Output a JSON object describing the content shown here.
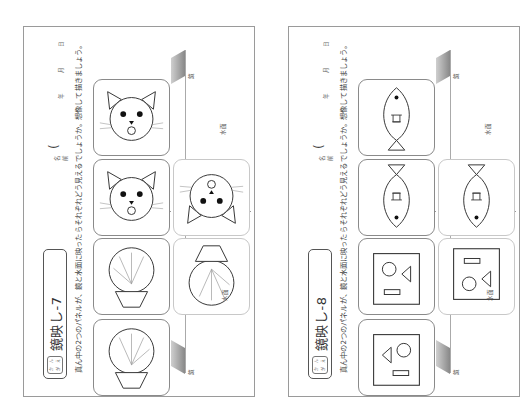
{
  "layout": {
    "orientation": "rotated-90-ccw",
    "pages_visible": 2
  },
  "pages": [
    {
      "title": "鏡映し-7",
      "grade_badge": [
        "か",
        "ん",
        "が",
        "え"
      ],
      "instructions": "真ん中の2つのパネルが、鏡と水面に映ったらそれぞれどう見えるでしょうか。想像して描きましょう。",
      "name_label": "名前",
      "date": {
        "year": "年",
        "month": "月",
        "day": "日"
      },
      "labels": {
        "mirror": "鏡",
        "water": "水面"
      },
      "panels": [
        {
          "position": "mirror-top",
          "figure": "cat-face",
          "orientation": "normal"
        },
        {
          "position": "center-top",
          "figure": "cat-face",
          "orientation": "normal"
        },
        {
          "position": "water-top",
          "figure": "cat-face",
          "orientation": "flipped"
        },
        {
          "position": "center-bottom",
          "figure": "shell",
          "orientation": "normal"
        },
        {
          "position": "water-bottom",
          "figure": "shell",
          "orientation": "flipped"
        },
        {
          "position": "mirror-bottom",
          "figure": "shell",
          "orientation": "mirrored"
        }
      ]
    },
    {
      "title": "鏡映し-8",
      "grade_badge": [
        "か",
        "ん",
        "が",
        "え"
      ],
      "instructions": "真ん中の2つのパネルが、鏡と水面に映ったらそれぞれどう見えるでしょうか。想像して描きましょう。",
      "name_label": "名前",
      "date": {
        "year": "年",
        "month": "月",
        "day": "日"
      },
      "labels": {
        "mirror": "鏡",
        "water": "水面"
      },
      "panels": [
        {
          "position": "mirror-top",
          "figure": "fish",
          "orientation": "normal"
        },
        {
          "position": "center-top",
          "figure": "fish",
          "orientation": "flipped"
        },
        {
          "position": "water-top",
          "figure": "fish",
          "orientation": "flipped"
        },
        {
          "position": "center-bottom",
          "figure": "shapes-square",
          "orientation": "normal"
        },
        {
          "position": "water-bottom",
          "figure": "shapes-square",
          "orientation": "flipped"
        },
        {
          "position": "mirror-bottom",
          "figure": "shapes-square",
          "orientation": "mirrored"
        }
      ]
    }
  ]
}
